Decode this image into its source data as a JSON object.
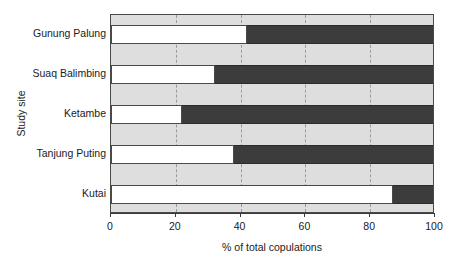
{
  "chart_data": {
    "type": "bar",
    "orientation": "horizontal",
    "stacked": true,
    "title": "",
    "xlabel": "% of total copulations",
    "ylabel": "Study site",
    "categories": [
      "Gunung Palung",
      "Suaq Balimbing",
      "Ketambe",
      "Tanjung Puting",
      "Kutai"
    ],
    "xlim": [
      0,
      100
    ],
    "xticks": [
      0,
      20,
      40,
      60,
      80,
      100
    ],
    "xtick_labels": [
      "0",
      "20",
      "40",
      "60",
      "80",
      "100"
    ],
    "grid": "vertical-dashed",
    "legend": "none",
    "series": [
      {
        "name": "light",
        "color": "#ffffff",
        "values": [
          42,
          32,
          22,
          38,
          87
        ]
      },
      {
        "name": "dark",
        "color": "#3c3c3c",
        "values": [
          58,
          68,
          78,
          62,
          13
        ]
      }
    ],
    "colors": {
      "band": "#dedede",
      "axis": "#3a3a3a",
      "gridline": "#9a9a9a",
      "bar_light": "#ffffff",
      "bar_dark": "#3c3c3c",
      "background": "#ffffff"
    }
  }
}
